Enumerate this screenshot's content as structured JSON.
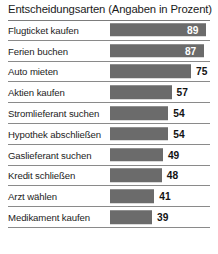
{
  "chart_data": {
    "type": "bar",
    "title": "Entscheidungsarten (Angaben in Prozent)",
    "xlabel": "",
    "ylabel": "",
    "orientation": "horizontal",
    "grid": false,
    "legend": "none",
    "xlim": [
      0,
      100
    ],
    "bar_color": "#6b6b6b",
    "value_inside_color": "#ffffff",
    "value_outside_color": "#131313",
    "separator_color": "#8a8a8a",
    "background_color": "#ffffff",
    "categories": [
      "Flugticket kaufen",
      "Ferien buchen",
      "Auto mieten",
      "Aktien kaufen",
      "Stromlieferant suchen",
      "Hypothek abschließen",
      "Gaslieferant suchen",
      "Kredit schließen",
      "Arzt wählen",
      "Medikament kaufen"
    ],
    "values": [
      89,
      87,
      75,
      57,
      54,
      54,
      49,
      48,
      41,
      39
    ],
    "value_placement": [
      "inside",
      "inside",
      "outside",
      "outside",
      "outside",
      "outside",
      "outside",
      "outside",
      "outside",
      "outside"
    ]
  }
}
